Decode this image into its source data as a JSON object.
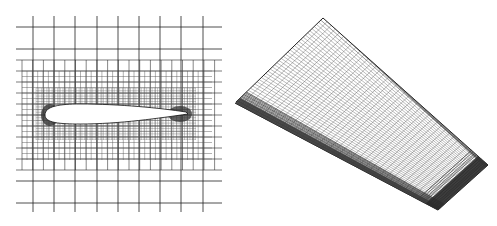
{
  "figure": {
    "panels": [
      {
        "id": "left",
        "description": "2D adaptive Cartesian mesh around an airfoil cross-section",
        "colors": {
          "line": "#222222",
          "refined": "#444444",
          "airfoil_fill": "#ffffff",
          "background": "#ffffff"
        }
      },
      {
        "id": "right",
        "description": "3D adaptive surface mesh on a tapered wing",
        "colors": {
          "line": "#333333",
          "edge_dense": "#2a2a2a",
          "surface": "#ffffff",
          "background": "#ffffff"
        }
      }
    ]
  }
}
